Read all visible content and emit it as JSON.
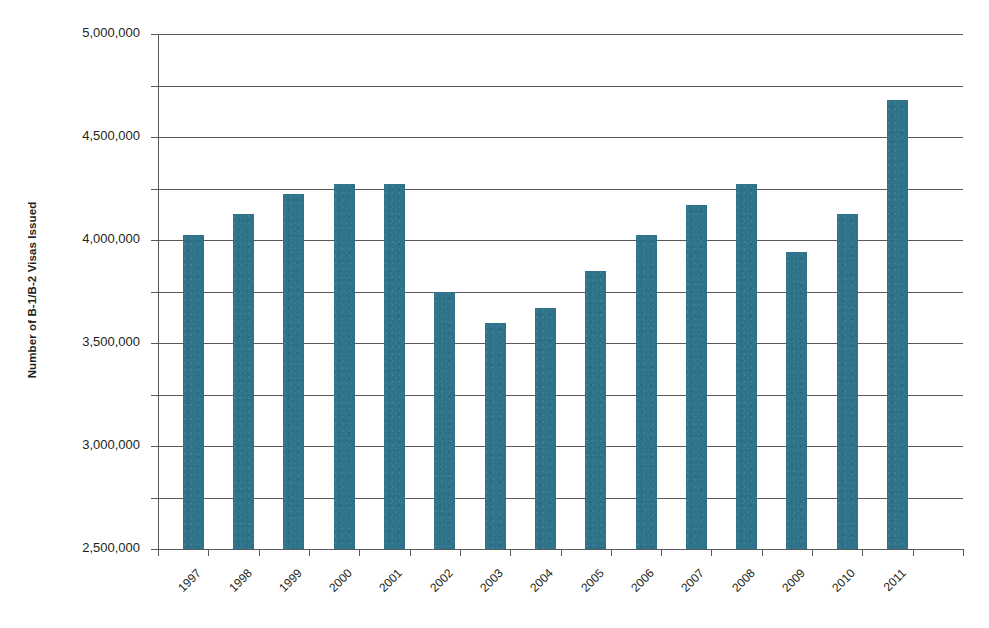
{
  "chart_data": {
    "type": "bar",
    "title": "",
    "xlabel": "",
    "ylabel": "Number of B-1/B-2 Visas Issued",
    "categories": [
      "1997",
      "1998",
      "1999",
      "2000",
      "2001",
      "2002",
      "2003",
      "2004",
      "2005",
      "2006",
      "2007",
      "2008",
      "2009",
      "2010",
      "2011"
    ],
    "values": [
      3050000,
      3250000,
      3450000,
      3545000,
      3545000,
      2500000,
      2190000,
      2340000,
      2700000,
      3050000,
      3340000,
      3545000,
      2880000,
      3255000,
      4355000
    ],
    "series": [
      {
        "name": "Number of B-1/B-2 Visas Issued",
        "values": [
          3050000,
          3250000,
          3450000,
          3545000,
          3545000,
          2500000,
          2190000,
          2340000,
          2700000,
          3050000,
          3340000,
          3545000,
          2880000,
          3255000,
          4355000
        ]
      }
    ],
    "ylim": [
      0,
      5000000
    ],
    "y_ticks": [
      0,
      500000,
      1000000,
      1500000,
      2000000,
      2500000,
      3000000,
      3500000,
      4000000,
      4500000,
      5000000
    ],
    "y_tick_labels": [
      "0",
      "500,000",
      "1,000,000",
      "1,500,000",
      "2,000,000",
      "2,500,000",
      "3,000,000",
      "3,500,000",
      "4,000,000",
      "4,500,000",
      "5,000,000"
    ],
    "grid": true,
    "legend": false,
    "legend_position": "none",
    "bar_color": "#2e7389",
    "axis_color": "#58595b",
    "x_tick_label_rotation": -45,
    "background_color": "#ffffff"
  },
  "axes": {
    "y_title": "Number of B-1/B-2 Visas Issued"
  },
  "artifacts": {
    "top_cut_text": ""
  }
}
